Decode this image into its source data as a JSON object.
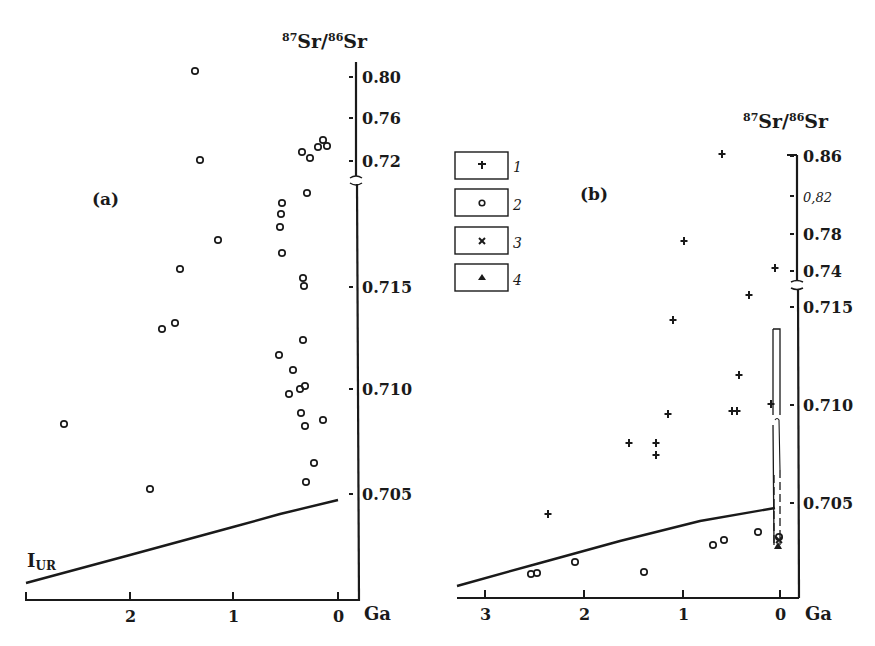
{
  "chart_data": [
    {
      "panel": "(a)",
      "type": "scatter",
      "xlabel": "Ga",
      "ylabel_parts": {
        "num_sup": "87",
        "num": "Sr",
        "den_sup": "86",
        "den": "Sr"
      },
      "x_ticks": [
        "2",
        "1",
        "0"
      ],
      "y_ticks": [
        "0.80",
        "0.76",
        "0.72",
        "0.715",
        "0.710",
        "0.705"
      ],
      "y_axis_break": "between 0.72 and 0.715",
      "xlim": [
        3,
        0
      ],
      "reference_line": {
        "label": "I",
        "label_sub": "UR",
        "from": {
          "ga": 3.0,
          "sr": 0.7013
        },
        "to": {
          "ga": 0.0,
          "sr": 0.7048
        }
      },
      "series": [
        {
          "name": "2",
          "marker": "circle",
          "points": [
            {
              "ga": 1.35,
              "sr": 0.803
            },
            {
              "ga": 1.3,
              "sr": 0.721
            },
            {
              "ga": 0.35,
              "sr": 0.724
            },
            {
              "ga": 0.27,
              "sr": 0.722
            },
            {
              "ga": 0.17,
              "sr": 0.727
            },
            {
              "ga": 0.13,
              "sr": 0.729
            },
            {
              "ga": 0.1,
              "sr": 0.727
            },
            {
              "ga": 0.3,
              "sr": 0.7185
            },
            {
              "ga": 0.55,
              "sr": 0.7182
            },
            {
              "ga": 0.55,
              "sr": 0.7179
            },
            {
              "ga": 0.56,
              "sr": 0.7176
            },
            {
              "ga": 1.15,
              "sr": 0.7172
            },
            {
              "ga": 0.55,
              "sr": 0.7168
            },
            {
              "ga": 1.5,
              "sr": 0.716
            },
            {
              "ga": 0.35,
              "sr": 0.7155
            },
            {
              "ga": 0.34,
              "sr": 0.715
            },
            {
              "ga": 1.7,
              "sr": 0.7134
            },
            {
              "ga": 1.58,
              "sr": 0.7136
            },
            {
              "ga": 0.34,
              "sr": 0.7122
            },
            {
              "ga": 0.57,
              "sr": 0.7117
            },
            {
              "ga": 0.43,
              "sr": 0.711
            },
            {
              "ga": 0.33,
              "sr": 0.7102
            },
            {
              "ga": 0.36,
              "sr": 0.71
            },
            {
              "ga": 0.47,
              "sr": 0.7098
            },
            {
              "ga": 2.68,
              "sr": 0.7085
            },
            {
              "ga": 0.37,
              "sr": 0.7089
            },
            {
              "ga": 0.32,
              "sr": 0.7083
            },
            {
              "ga": 0.15,
              "sr": 0.7086
            },
            {
              "ga": 0.24,
              "sr": 0.7065
            },
            {
              "ga": 1.82,
              "sr": 0.7052
            },
            {
              "ga": 0.32,
              "sr": 0.7056
            }
          ]
        }
      ]
    },
    {
      "panel": "(b)",
      "type": "scatter",
      "xlabel": "Ga",
      "ylabel_parts": {
        "num_sup": "87",
        "num": "Sr",
        "den_sup": "86",
        "den": "Sr"
      },
      "x_ticks": [
        "3",
        "2",
        "1",
        "0"
      ],
      "y_ticks": [
        "0.86",
        "0.82",
        "0.78",
        "0.74",
        "0.715",
        "0.710",
        "0.705"
      ],
      "y_axis_break": "between 0.74 and 0.715",
      "xlim": [
        3.3,
        0
      ],
      "reference_line": {
        "from": {
          "ga": 3.3,
          "sr": 0.7008
        },
        "to": {
          "ga": 0.0,
          "sr": 0.7048
        }
      },
      "series": [
        {
          "name": "1",
          "marker": "plus",
          "points": [
            {
              "ga": 0.6,
              "sr": 0.862
            },
            {
              "ga": 0.97,
              "sr": 0.795
            },
            {
              "ga": 0.03,
              "sr": 0.745
            },
            {
              "ga": 0.33,
              "sr": 0.7175
            },
            {
              "ga": 1.12,
              "sr": 0.7143
            },
            {
              "ga": 0.42,
              "sr": 0.7115
            },
            {
              "ga": 1.13,
              "sr": 0.7093
            },
            {
              "ga": 0.5,
              "sr": 0.7095
            },
            {
              "ga": 0.45,
              "sr": 0.7095
            },
            {
              "ga": 0.08,
              "sr": 0.71
            },
            {
              "ga": 1.53,
              "sr": 0.7079
            },
            {
              "ga": 1.25,
              "sr": 0.7079
            },
            {
              "ga": 1.25,
              "sr": 0.7073
            },
            {
              "ga": 2.35,
              "sr": 0.7044
            }
          ]
        },
        {
          "name": "2",
          "marker": "circle",
          "points": [
            {
              "ga": 0.22,
              "sr": 0.7034
            },
            {
              "ga": 0.57,
              "sr": 0.7031
            },
            {
              "ga": 0.68,
              "sr": 0.7028
            },
            {
              "ga": 0.0,
              "sr": 0.7032
            },
            {
              "ga": 2.1,
              "sr": 0.702
            },
            {
              "ga": 1.38,
              "sr": 0.7015
            },
            {
              "ga": 2.5,
              "sr": 0.7014
            },
            {
              "ga": 2.55,
              "sr": 0.7013
            }
          ]
        },
        {
          "name": "3",
          "marker": "cross",
          "points": [
            {
              "ga": 0.01,
              "sr": 0.7031
            }
          ]
        },
        {
          "name": "4",
          "marker": "triangle",
          "points": [
            {
              "ga": 0.01,
              "sr": 0.7028
            }
          ]
        }
      ],
      "range_box": {
        "ga": 0.0,
        "sr_min": 0.7028,
        "sr_max": 0.7138,
        "style": "solid upper, dashed lower"
      }
    }
  ],
  "panels": {
    "a": {
      "label": "(a)",
      "xlabel": "Ga",
      "ylabel_sup1": "87",
      "ylabel_main1": "Sr",
      "ylabel_slash": "/",
      "ylabel_sup2": "86",
      "ylabel_main2": "Sr",
      "iur_main": "I",
      "iur_sub": "UR",
      "x_ticks": [
        {
          "label": "2",
          "px": 130
        },
        {
          "label": "1",
          "px": 233
        },
        {
          "label": "0",
          "px": 338
        }
      ],
      "y_ticks": [
        {
          "label": "0.80",
          "py": 77
        },
        {
          "label": "0.76",
          "py": 118
        },
        {
          "label": "0.72",
          "py": 161
        },
        {
          "label": "0.715",
          "py": 287
        },
        {
          "label": "0.710",
          "py": 389
        },
        {
          "label": "0.705",
          "py": 494
        }
      ],
      "points": [
        [
          195,
          71
        ],
        [
          200,
          160
        ],
        [
          302,
          152
        ],
        [
          310,
          158
        ],
        [
          318,
          147
        ],
        [
          323,
          140
        ],
        [
          327,
          146
        ],
        [
          307,
          193
        ],
        [
          282,
          203
        ],
        [
          281,
          214
        ],
        [
          280,
          227
        ],
        [
          218,
          240
        ],
        [
          282,
          253
        ],
        [
          180,
          269
        ],
        [
          303,
          278
        ],
        [
          304,
          286
        ],
        [
          162,
          329
        ],
        [
          175,
          323
        ],
        [
          303,
          340
        ],
        [
          279,
          355
        ],
        [
          293,
          370
        ],
        [
          305,
          386
        ],
        [
          300,
          389
        ],
        [
          289,
          394
        ],
        [
          64,
          424
        ],
        [
          301,
          413
        ],
        [
          305,
          426
        ],
        [
          323,
          420
        ],
        [
          314,
          463
        ],
        [
          150,
          489
        ],
        [
          306,
          482
        ]
      ]
    },
    "b": {
      "label": "(b)",
      "xlabel": "Ga",
      "ylabel_sup1": "87",
      "ylabel_main1": "Sr",
      "ylabel_slash": "/",
      "ylabel_sup2": "86",
      "ylabel_main2": "Sr",
      "x_ticks": [
        {
          "label": "3",
          "px": 485
        },
        {
          "label": "2",
          "px": 584
        },
        {
          "label": "1",
          "px": 683
        },
        {
          "label": "0",
          "px": 780
        }
      ],
      "y_ticks": [
        {
          "label": "0.86",
          "py": 156,
          "italic": false
        },
        {
          "label": "0,82",
          "py": 196,
          "italic": true
        },
        {
          "label": "0.78",
          "py": 234,
          "italic": false
        },
        {
          "label": "0.74",
          "py": 271,
          "italic": false
        },
        {
          "label": "0.715",
          "py": 307,
          "italic": false
        },
        {
          "label": "0.710",
          "py": 405,
          "italic": false
        },
        {
          "label": "0.705",
          "py": 503,
          "italic": false
        }
      ],
      "plus_points": [
        [
          722,
          154
        ],
        [
          684,
          241
        ],
        [
          775,
          268
        ],
        [
          749,
          295
        ],
        [
          673,
          320
        ],
        [
          739,
          375
        ],
        [
          668,
          414
        ],
        [
          732,
          411
        ],
        [
          737,
          411
        ],
        [
          771,
          404
        ],
        [
          629,
          443
        ],
        [
          656,
          443
        ],
        [
          656,
          455
        ],
        [
          548,
          514
        ]
      ],
      "circle_points": [
        [
          758,
          532
        ],
        [
          724,
          540
        ],
        [
          713,
          545
        ],
        [
          779,
          537
        ],
        [
          575,
          562
        ],
        [
          644,
          572
        ],
        [
          531,
          574
        ],
        [
          537,
          573
        ]
      ],
      "cross_points": [
        [
          779,
          540
        ]
      ],
      "triangle_points": [
        [
          778,
          546
        ]
      ]
    }
  },
  "legend": {
    "items": [
      {
        "symbol": "plus",
        "label": "1"
      },
      {
        "symbol": "circle",
        "label": "2"
      },
      {
        "symbol": "cross",
        "label": "3"
      },
      {
        "symbol": "triangle",
        "label": "4"
      }
    ]
  },
  "colors": {
    "ink": "#1a1a1a",
    "background": "#ffffff"
  }
}
